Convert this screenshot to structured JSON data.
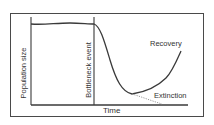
{
  "diagram": {
    "y_axis_label": "Population size",
    "x_axis_label": "Time",
    "event_label": "Bottleneck event",
    "outcomes": [
      {
        "label": "Recovery",
        "style": "solid"
      },
      {
        "label": "Extinction",
        "style": "dotted"
      }
    ],
    "colors": {
      "line": "#3a3a3a",
      "dotted": "#9a9a9a",
      "frame": "#4a4a4a",
      "text": "#333333"
    }
  }
}
